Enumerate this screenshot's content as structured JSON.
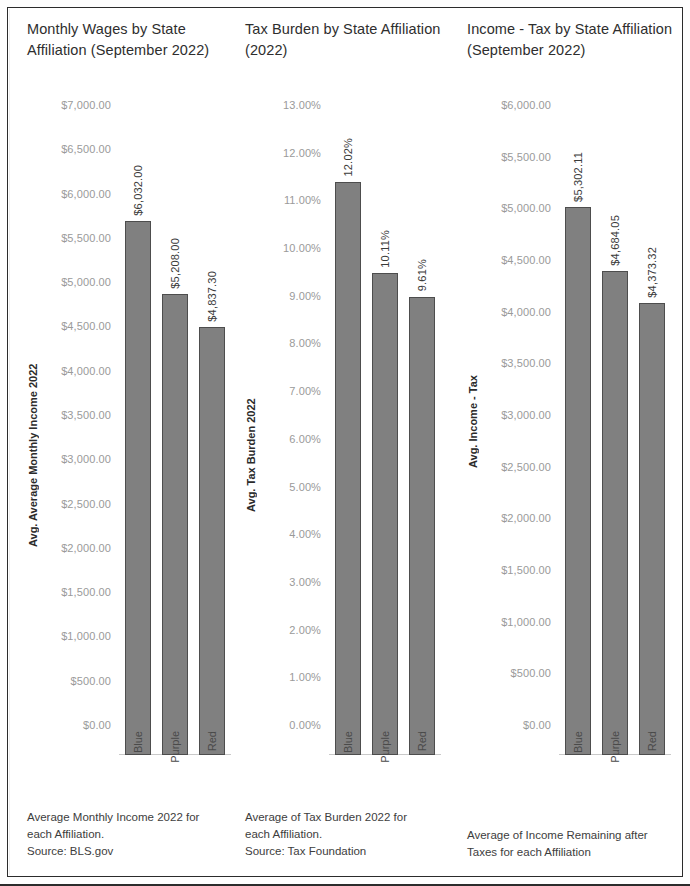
{
  "chart_data": [
    {
      "type": "bar",
      "title": "Monthly Wages by State Affiliation (September 2022)",
      "ylabel": "Avg. Average Monthly Income 2022",
      "xlabel": "",
      "categories": [
        "Blue",
        "Purple",
        "Red"
      ],
      "values": [
        6032.0,
        5208.0,
        4837.3
      ],
      "value_labels": [
        "$6,032.00",
        "$5,208.00",
        "$4,837.30"
      ],
      "ylim": [
        0,
        7000
      ],
      "ytick_values": [
        7000,
        6500,
        6000,
        5500,
        5000,
        4500,
        4000,
        3500,
        3000,
        2500,
        2000,
        1500,
        1000,
        500,
        0
      ],
      "ytick_labels": [
        "$7,000.00",
        "$6,500.00",
        "$6,000.00",
        "$5,500.00",
        "$5,000.00",
        "$4,500.00",
        "$4,000.00",
        "$3,500.00",
        "$3,000.00",
        "$2,500.00",
        "$2,000.00",
        "$1,500.00",
        "$1,000.00",
        "$500.00",
        "$0.00"
      ],
      "grid": false,
      "legend": "none",
      "bar_color": "#808080",
      "bar_border_color": "#4d4d4d",
      "caption": "Average Monthly Income 2022 for each Affiliation.\nSource: BLS.gov"
    },
    {
      "type": "bar",
      "title": "Tax Burden by State Affiliation (2022)",
      "ylabel": "Avg. Tax Burden 2022",
      "xlabel": "",
      "categories": [
        "Blue",
        "Purple",
        "Red"
      ],
      "values": [
        12.02,
        10.11,
        9.61
      ],
      "value_labels": [
        "12.02%",
        "10.11%",
        "9.61%"
      ],
      "ylim": [
        0,
        13
      ],
      "ytick_values": [
        13,
        12,
        11,
        10,
        9,
        8,
        7,
        6,
        5,
        4,
        3,
        2,
        1,
        0
      ],
      "ytick_labels": [
        "13.00%",
        "12.00%",
        "11.00%",
        "10.00%",
        "9.00%",
        "8.00%",
        "7.00%",
        "6.00%",
        "5.00%",
        "4.00%",
        "3.00%",
        "2.00%",
        "1.00%",
        "0.00%"
      ],
      "grid": false,
      "legend": "none",
      "bar_color": "#808080",
      "bar_border_color": "#4d4d4d",
      "caption": "Average of Tax Burden 2022 for each Affiliation.\nSource: Tax Foundation"
    },
    {
      "type": "bar",
      "title": "Income - Tax by State Affiliation (September 2022)",
      "ylabel": "Avg. Income - Tax",
      "xlabel": "",
      "categories": [
        "Blue",
        "Purple",
        "Red"
      ],
      "values": [
        5302.11,
        4684.05,
        4373.32
      ],
      "value_labels": [
        "$5,302.11",
        "$4,684.05",
        "$4,373.32"
      ],
      "ylim": [
        0,
        6000
      ],
      "ytick_values": [
        6000,
        5500,
        5000,
        4500,
        4000,
        3500,
        3000,
        2500,
        2000,
        1500,
        1000,
        500,
        0
      ],
      "ytick_labels": [
        "$6,000.00",
        "$5,500.00",
        "$5,000.00",
        "$4,500.00",
        "$4,000.00",
        "$3,500.00",
        "$3,000.00",
        "$2,500.00",
        "$2,000.00",
        "$1,500.00",
        "$1,000.00",
        "$500.00",
        "$0.00"
      ],
      "grid": false,
      "legend": "none",
      "bar_color": "#808080",
      "bar_border_color": "#4d4d4d",
      "caption": "Average of Income Remaining after Taxes for each Affiliation"
    }
  ],
  "panels": [
    {
      "title": "Monthly Wages by State Affiliation (September 2022)",
      "axis_title": "Avg. Average Monthly Income 2022",
      "caption_lines": [
        "Average Monthly Income 2022 for",
        "each Affiliation.",
        "Source: BLS.gov"
      ]
    },
    {
      "title": "Tax Burden by State Affiliation (2022)",
      "axis_title": "Avg. Tax Burden 2022",
      "caption_lines": [
        "Average of Tax Burden 2022 for",
        "each Affiliation.",
        "Source: Tax Foundation"
      ]
    },
    {
      "title": "Income - Tax by State Affiliation (September 2022)",
      "axis_title": "Avg. Income - Tax",
      "caption_lines": [
        "Average of Income Remaining after",
        "Taxes for each Affiliation"
      ]
    }
  ]
}
